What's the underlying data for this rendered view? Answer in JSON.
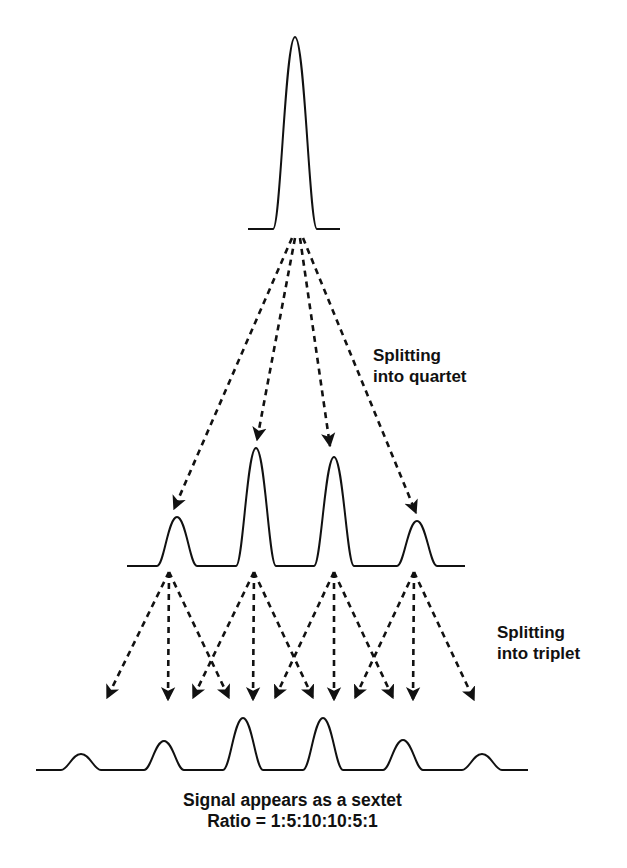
{
  "labels": {
    "quartet": {
      "line1": "Splitting",
      "line2": "into quartet"
    },
    "triplet": {
      "line1": "Splitting",
      "line2": "into triplet"
    },
    "caption": {
      "line1": "Signal appears as a sextet",
      "line2": "Ratio = 1:5:10:10:5:1"
    }
  },
  "colors": {
    "stroke": "#111111",
    "background": "#ffffff"
  },
  "spectra": {
    "singlet": {
      "baseline_y": 229,
      "x_start": 248,
      "x_end": 340,
      "peaks": [
        {
          "x": 295,
          "top_y": 37,
          "half_width": 22
        }
      ]
    },
    "quartet": {
      "baseline_y": 566,
      "x_start": 127,
      "x_end": 465,
      "peaks": [
        {
          "x": 177,
          "top_y": 517,
          "half_width": 20
        },
        {
          "x": 256,
          "top_y": 448,
          "half_width": 20
        },
        {
          "x": 334,
          "top_y": 457,
          "half_width": 20
        },
        {
          "x": 417,
          "top_y": 521,
          "half_width": 20
        }
      ]
    },
    "sextet": {
      "baseline_y": 770,
      "x_start": 36,
      "x_end": 528,
      "peaks": [
        {
          "x": 81,
          "top_y": 754,
          "half_width": 20
        },
        {
          "x": 164,
          "top_y": 741,
          "half_width": 20
        },
        {
          "x": 243,
          "top_y": 718,
          "half_width": 20
        },
        {
          "x": 323,
          "top_y": 718,
          "half_width": 20
        },
        {
          "x": 403,
          "top_y": 740,
          "half_width": 20
        },
        {
          "x": 482,
          "top_y": 754,
          "half_width": 20
        }
      ]
    }
  },
  "arrows": {
    "quartet_split": [
      {
        "from": [
          292,
          238
        ],
        "to": [
          174,
          509
        ]
      },
      {
        "from": [
          295,
          238
        ],
        "to": [
          257,
          440
        ]
      },
      {
        "from": [
          300,
          238
        ],
        "to": [
          330,
          446
        ]
      },
      {
        "from": [
          303,
          238
        ],
        "to": [
          416,
          513
        ]
      }
    ],
    "triplet_split": [
      {
        "from": [
          169,
          572
        ],
        "to": [
          107,
          698
        ]
      },
      {
        "from": [
          169,
          572
        ],
        "to": [
          168,
          700
        ]
      },
      {
        "from": [
          169,
          572
        ],
        "to": [
          229,
          698
        ]
      },
      {
        "from": [
          254,
          572
        ],
        "to": [
          193,
          698
        ]
      },
      {
        "from": [
          254,
          572
        ],
        "to": [
          253,
          700
        ]
      },
      {
        "from": [
          254,
          572
        ],
        "to": [
          313,
          698
        ]
      },
      {
        "from": [
          334,
          572
        ],
        "to": [
          275,
          698
        ]
      },
      {
        "from": [
          334,
          572
        ],
        "to": [
          334,
          700
        ]
      },
      {
        "from": [
          334,
          572
        ],
        "to": [
          393,
          698
        ]
      },
      {
        "from": [
          414,
          572
        ],
        "to": [
          355,
          698
        ]
      },
      {
        "from": [
          414,
          572
        ],
        "to": [
          413,
          700
        ]
      },
      {
        "from": [
          414,
          572
        ],
        "to": [
          474,
          700
        ]
      }
    ]
  }
}
